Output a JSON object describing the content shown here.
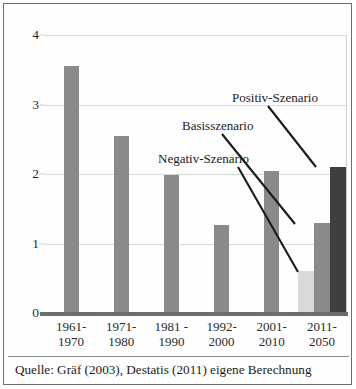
{
  "chart_data": {
    "type": "bar",
    "title": "",
    "xlabel": "",
    "ylabel": "",
    "ylim": [
      0,
      4
    ],
    "yticks": [
      0,
      1,
      2,
      3,
      4
    ],
    "grid": true,
    "legend": "none",
    "categories": [
      "1961-\n1970",
      "1971-\n1980",
      "1981 -\n1990",
      "1992-\n2000",
      "2001-\n2010",
      "2011-\n2050"
    ],
    "category_lines": [
      [
        "1961-",
        "1970"
      ],
      [
        "1971-",
        "1980"
      ],
      [
        "1981 -",
        "1990"
      ],
      [
        "1992-",
        "2000"
      ],
      [
        "2001-",
        "2010"
      ],
      [
        "2011-",
        "2050"
      ]
    ],
    "bars": [
      {
        "category": "1961-1970",
        "value": 3.55,
        "color": "#8a8a8a",
        "scenario": ""
      },
      {
        "category": "1971-1980",
        "value": 2.55,
        "color": "#8a8a8a",
        "scenario": ""
      },
      {
        "category": "1981 - 1990",
        "value": 1.98,
        "color": "#8a8a8a",
        "scenario": ""
      },
      {
        "category": "1992-2000",
        "value": 1.27,
        "color": "#8a8a8a",
        "scenario": ""
      },
      {
        "category": "2001-2010",
        "value": 2.05,
        "color": "#8a8a8a",
        "scenario": ""
      },
      {
        "category": "2011-2050",
        "value": 0.6,
        "color": "#d9d9d9",
        "scenario": "Negativ-Szenario"
      },
      {
        "category": "2011-2050",
        "value": 1.3,
        "color": "#8a8a8a",
        "scenario": "Basisszenario"
      },
      {
        "category": "2011-2050",
        "value": 2.1,
        "color": "#3f3f3f",
        "scenario": "Positiv-Szenario"
      }
    ],
    "annotations": [
      {
        "label": "Positiv-Szenario",
        "target": "2011-2050 dark bar"
      },
      {
        "label": "Basisszenario",
        "target": "2011-2050 medium bar"
      },
      {
        "label": "Negativ-Szenario",
        "target": "2011-2050 light bar"
      }
    ]
  },
  "source": {
    "text": "Quelle: Gräf (2003), Destatis (2011) eigene Berechnung"
  },
  "colors": {
    "bar_default": "#8a8a8a",
    "bar_light": "#d9d9d9",
    "bar_dark": "#3f3f3f",
    "grid": "#d9d9d9",
    "axis": "#6d6d6d",
    "frame": "#6e6e6e",
    "text": "#1b1b1b"
  }
}
